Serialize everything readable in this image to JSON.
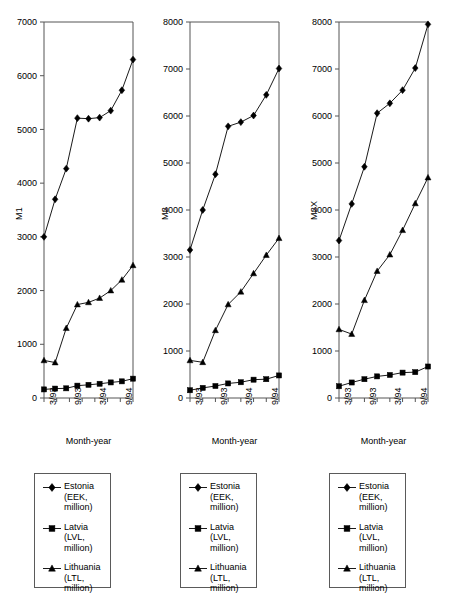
{
  "figure": {
    "background": "#ffffff",
    "line_color": "#000000",
    "marker_color": "#000000",
    "axis_color": "#555555"
  },
  "x_axis": {
    "label": "Month-year",
    "tick_labels": [
      "3/93",
      "9/93",
      "3/94",
      "9/94"
    ],
    "all_ticks": 8,
    "labeled_every": 2
  },
  "legend": {
    "entries": [
      {
        "marker": "diamond",
        "label": "Estonia\n(EEK,\nmillion)"
      },
      {
        "marker": "square",
        "label": "Latvia\n(LVL,\nmillion)"
      },
      {
        "marker": "triangle",
        "label": "Lithuania\n(LTL,\nmillion)"
      }
    ]
  },
  "chart_data": [
    {
      "type": "line",
      "title": "",
      "xlabel": "Month-year",
      "ylabel": "M1",
      "ylim": [
        0,
        7000
      ],
      "yticks": [
        0,
        1000,
        2000,
        3000,
        4000,
        5000,
        6000,
        7000
      ],
      "ytick_labels": [
        "0",
        "1000",
        "2000",
        "3000",
        "4000",
        "5000",
        "6000",
        "7000"
      ],
      "x": [
        "3/93",
        "6/93",
        "9/93",
        "12/93",
        "3/94",
        "6/94",
        "9/94",
        "12/94"
      ],
      "xtick_labels": [
        "3/93",
        "9/93",
        "3/94",
        "9/94"
      ],
      "grid": false,
      "legend_position": "below",
      "series": [
        {
          "name": "Estonia (EEK, million)",
          "marker": "diamond",
          "values": [
            3000,
            3700,
            4270,
            5210,
            5200,
            5220,
            5350,
            5730,
            6300
          ]
        },
        {
          "name": "Latvia (LVL, million)",
          "marker": "square",
          "values": [
            160,
            175,
            180,
            230,
            245,
            265,
            290,
            310,
            360
          ]
        },
        {
          "name": "Lithuania (LTL, million)",
          "marker": "triangle",
          "values": [
            700,
            660,
            1300,
            1740,
            1780,
            1860,
            2000,
            2200,
            2470
          ]
        }
      ]
    },
    {
      "type": "line",
      "title": "",
      "xlabel": "Month-year",
      "ylabel": "M2",
      "ylim": [
        0,
        8000
      ],
      "yticks": [
        0,
        1000,
        2000,
        3000,
        4000,
        5000,
        6000,
        7000,
        8000
      ],
      "ytick_labels": [
        "0",
        "1000",
        "2000",
        "3000",
        "4000",
        "5000",
        "6000",
        "7000",
        "8000"
      ],
      "x": [
        "3/93",
        "6/93",
        "9/93",
        "12/93",
        "3/94",
        "6/94",
        "9/94",
        "12/94"
      ],
      "xtick_labels": [
        "3/93",
        "9/93",
        "3/94",
        "9/94"
      ],
      "grid": false,
      "legend_position": "below",
      "series": [
        {
          "name": "Estonia (EEK, million)",
          "marker": "diamond",
          "values": [
            3150,
            4000,
            4760,
            5780,
            5870,
            6010,
            6450,
            7010
          ]
        },
        {
          "name": "Latvia (LVL, million)",
          "marker": "square",
          "values": [
            165,
            215,
            255,
            310,
            335,
            390,
            400,
            480
          ]
        },
        {
          "name": "Lithuania (LTL, million)",
          "marker": "triangle",
          "values": [
            800,
            760,
            1440,
            1990,
            2260,
            2650,
            3040,
            3400
          ]
        }
      ]
    },
    {
      "type": "line",
      "title": "",
      "xlabel": "Month-year",
      "ylabel": "M2X",
      "ylim": [
        0,
        8000
      ],
      "yticks": [
        0,
        1000,
        2000,
        3000,
        4000,
        5000,
        6000,
        7000,
        8000
      ],
      "ytick_labels": [
        "0",
        "1000",
        "2000",
        "3000",
        "4000",
        "5000",
        "6000",
        "7000",
        "8000"
      ],
      "x": [
        "3/93",
        "6/93",
        "9/93",
        "12/93",
        "3/94",
        "6/94",
        "9/94",
        "12/94"
      ],
      "xtick_labels": [
        "3/93",
        "9/93",
        "3/94",
        "9/94"
      ],
      "grid": false,
      "legend_position": "below",
      "series": [
        {
          "name": "Estonia (EEK, million)",
          "marker": "diamond",
          "values": [
            3350,
            4130,
            4920,
            6060,
            6270,
            6550,
            7020,
            7950
          ]
        },
        {
          "name": "Latvia (LVL, million)",
          "marker": "square",
          "values": [
            250,
            330,
            400,
            460,
            490,
            540,
            550,
            670
          ]
        },
        {
          "name": "Lithuania (LTL, million)",
          "marker": "triangle",
          "values": [
            1460,
            1360,
            2080,
            2700,
            3050,
            3570,
            4140,
            4690
          ]
        }
      ]
    }
  ]
}
